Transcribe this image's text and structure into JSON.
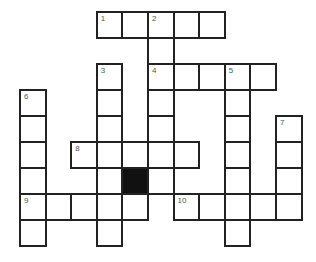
{
  "puzzle": {
    "type": "crossword",
    "grid": {
      "origin_x": 20,
      "origin_y": 12,
      "cell_w": 25.6,
      "cell_h": 26,
      "cols": 11,
      "rows": 9
    },
    "entries": [
      {
        "number": "1",
        "direction": "across",
        "row": 0,
        "col": 3,
        "length": 5
      },
      {
        "number": "2",
        "direction": "down",
        "row": 0,
        "col": 5,
        "length": 7
      },
      {
        "number": "3",
        "direction": "down",
        "row": 2,
        "col": 3,
        "length": 7
      },
      {
        "number": "4",
        "direction": "across",
        "row": 2,
        "col": 5,
        "length": 5
      },
      {
        "number": "5",
        "direction": "down",
        "row": 2,
        "col": 8,
        "length": 7
      },
      {
        "number": "6",
        "direction": "down",
        "row": 3,
        "col": 0,
        "length": 6
      },
      {
        "number": "7",
        "direction": "down",
        "row": 4,
        "col": 10,
        "length": 4
      },
      {
        "number": "8",
        "direction": "across",
        "row": 5,
        "col": 2,
        "length": 5
      },
      {
        "number": "9",
        "direction": "across",
        "row": 7,
        "col": 0,
        "length": 5
      },
      {
        "number": "10",
        "direction": "across",
        "row": 7,
        "col": 6,
        "length": 5
      }
    ],
    "blocks": [
      {
        "row": 6,
        "col": 4
      }
    ],
    "colors": {
      "border": "#222222",
      "block": "#111111",
      "number": "#555555",
      "background": "#ffffff"
    }
  }
}
